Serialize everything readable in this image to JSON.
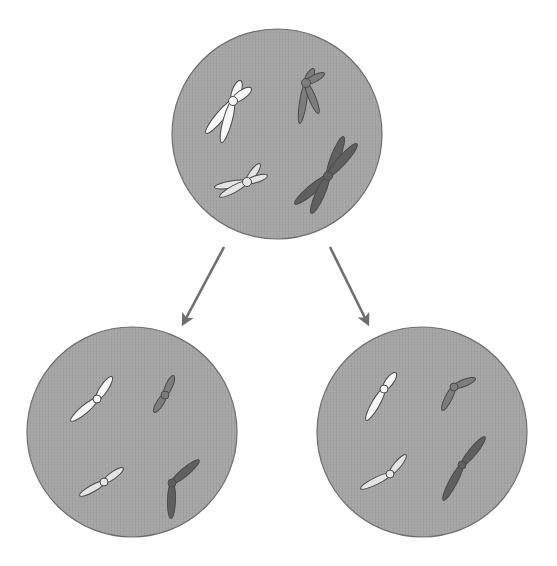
{
  "diagram": {
    "title": "",
    "background": "#ffffff",
    "colors": {
      "cell_fill": "#a3a3a3",
      "cell_stroke": "#6e6e6e",
      "arrow": "#6f6f6f",
      "chromosome_white": "#f7f7f7",
      "chromosome_light": "#e4e4e4",
      "chromosome_mid": "#7d7d7d",
      "chromosome_dark": "#5f5f5f",
      "chromosome_stroke": "#4a4a4a"
    },
    "cells": [
      {
        "id": "parent-cell",
        "label": "",
        "cx": 277,
        "cy": 134,
        "r": 105,
        "chromosomes": [
          {
            "name": "large-white-replicated",
            "type": "x",
            "color": "chromosome_white",
            "centromere": [
              233,
              101
            ],
            "arms": [
              [
                219,
                126,
                213,
                136
              ],
              [
                227,
                137,
                216,
                150
              ],
              [
                240,
                82,
                228,
                89
              ],
              [
                249,
                91,
                243,
                97
              ]
            ],
            "arm_ends": [
              [
                207,
                132
              ],
              [
                222,
                141
              ],
              [
                240,
                82
              ],
              [
                250,
                89
              ]
            ]
          },
          {
            "name": "small-dark-replicated",
            "type": "x",
            "color": "chromosome_mid",
            "centromere": [
              306,
              83
            ],
            "arms": [],
            "arm_ends": [
              [
                300,
                122
              ],
              [
                318,
                112
              ],
              [
                313,
                70
              ],
              [
                323,
                74
              ]
            ]
          },
          {
            "name": "small-light-replicated",
            "type": "x",
            "color": "chromosome_light",
            "centromere": [
              247,
              182
            ],
            "arms": [],
            "arm_ends": [
              [
                216,
                187
              ],
              [
                221,
                196
              ],
              [
                259,
                165
              ],
              [
                266,
                176
              ]
            ]
          },
          {
            "name": "large-dark-replicated",
            "type": "x",
            "color": "chromosome_dark",
            "centromere": [
              328,
              176
            ],
            "arms": [],
            "arm_ends": [
              [
                296,
                203
              ],
              [
                312,
                212
              ],
              [
                343,
                138
              ],
              [
                356,
                145
              ]
            ]
          }
        ]
      },
      {
        "id": "daughter-cell-left",
        "label": "",
        "cx": 132,
        "cy": 432,
        "r": 105,
        "chromosomes": [
          {
            "name": "large-white",
            "type": "single",
            "color": "chromosome_white",
            "centromere": [
              97,
              399
            ],
            "arm_ends": [
              [
                72,
                420
              ],
              [
                111,
                378
              ]
            ]
          },
          {
            "name": "small-dark",
            "type": "single",
            "color": "chromosome_mid",
            "centromere": [
              165,
              395
            ],
            "arm_ends": [
              [
                155,
                411
              ],
              [
                173,
                377
              ]
            ]
          },
          {
            "name": "small-light",
            "type": "single",
            "color": "chromosome_light",
            "centromere": [
              104,
              482
            ],
            "arm_ends": [
              [
                81,
                495
              ],
              [
                122,
                469
              ]
            ]
          },
          {
            "name": "large-dark",
            "type": "single",
            "color": "chromosome_dark",
            "centromere": [
              172,
              483
            ],
            "arm_ends": [
              [
                198,
                461
              ],
              [
                171,
                517
              ]
            ]
          }
        ]
      },
      {
        "id": "daughter-cell-right",
        "label": "",
        "cx": 422,
        "cy": 432,
        "r": 105,
        "chromosomes": [
          {
            "name": "large-white",
            "type": "single",
            "color": "chromosome_white",
            "centromere": [
              384,
              389
            ],
            "arm_ends": [
              [
                367,
                419
              ],
              [
                395,
                374
              ]
            ]
          },
          {
            "name": "small-dark",
            "type": "single",
            "color": "chromosome_mid",
            "centromere": [
              454,
              387
            ],
            "arm_ends": [
              [
                443,
                409
              ],
              [
                474,
                379
              ]
            ]
          },
          {
            "name": "small-light",
            "type": "single",
            "color": "chromosome_light",
            "centromere": [
              390,
              474
            ],
            "arm_ends": [
              [
                362,
                488
              ],
              [
                405,
                456
              ]
            ]
          },
          {
            "name": "large-dark",
            "type": "single",
            "color": "chromosome_dark",
            "centromere": [
              462,
              465
            ],
            "arm_ends": [
              [
                484,
                438
              ],
              [
                444,
                499
              ]
            ]
          }
        ]
      }
    ],
    "arrows": [
      {
        "id": "arrow-to-left-daughter",
        "x1": 224,
        "y1": 247,
        "x2": 183,
        "y2": 324
      },
      {
        "id": "arrow-to-right-daughter",
        "x1": 330,
        "y1": 247,
        "x2": 368,
        "y2": 324
      }
    ]
  }
}
